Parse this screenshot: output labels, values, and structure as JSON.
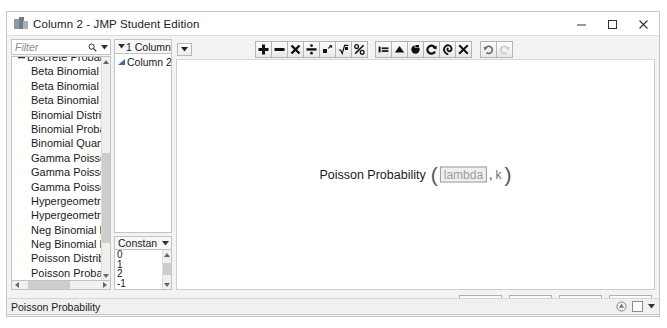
{
  "window": {
    "title": "Column 2 - JMP Student Edition",
    "app_icon": "jmp-app-icon",
    "controls": {
      "minimize": "minimize-icon",
      "maximize": "maximize-icon",
      "close": "close-icon"
    }
  },
  "filter": {
    "placeholder": "Filter",
    "value": "",
    "search_icon": "search-icon",
    "dropdown_icon": "chevron-down-icon"
  },
  "function_tree": {
    "nodes": [
      {
        "label": "Discrete Probability",
        "type": "group",
        "expanded": true,
        "twisty": "minus-twisty-icon",
        "clipped": true
      },
      {
        "label": "Beta Binomial D",
        "type": "leaf"
      },
      {
        "label": "Beta Binomial Pr",
        "type": "leaf"
      },
      {
        "label": "Beta Binomial Q",
        "type": "leaf"
      },
      {
        "label": "Binomial Distrib",
        "type": "leaf"
      },
      {
        "label": "Binomial Probab",
        "type": "leaf"
      },
      {
        "label": "Binomial Quanti",
        "type": "leaf"
      },
      {
        "label": "Gamma Poisson",
        "type": "leaf"
      },
      {
        "label": "Gamma Poisson",
        "type": "leaf"
      },
      {
        "label": "Gamma Poisson",
        "type": "leaf"
      },
      {
        "label": "Hypergeometric",
        "type": "leaf"
      },
      {
        "label": "Hypergeometric",
        "type": "leaf"
      },
      {
        "label": "Neg Binomial Di",
        "type": "leaf"
      },
      {
        "label": "Neg Binomial Pr",
        "type": "leaf"
      },
      {
        "label": "Poisson Distribut",
        "type": "leaf"
      },
      {
        "label": "Poisson Probabil",
        "type": "leaf"
      },
      {
        "label": "Poisson Quantile",
        "type": "leaf"
      },
      {
        "label": "Statistical",
        "type": "group",
        "expanded": false,
        "twisty": "right-twisty-icon"
      },
      {
        "label": "Random",
        "type": "group",
        "expanded": false,
        "twisty": "right-twisty-icon"
      },
      {
        "label": "Date Time",
        "type": "group",
        "expanded": false,
        "twisty": "right-twisty-icon"
      },
      {
        "label": "Row State",
        "type": "group",
        "expanded": false,
        "twisty": "right-twisty-icon"
      },
      {
        "label": "Assignment",
        "type": "group",
        "expanded": false,
        "twisty": "right-twisty-icon"
      }
    ]
  },
  "columns_panel": {
    "header": "1 Columns",
    "header_caret": "chevron-down-icon",
    "items": [
      {
        "label": "Column 2",
        "icon": "continuous-column-icon"
      }
    ]
  },
  "constants_panel": {
    "header": "Constan",
    "header_caret": "chevron-down-icon",
    "values": [
      "0",
      "1",
      "2",
      "-1"
    ]
  },
  "editor": {
    "panel_menu_icon": "panel-menu-icon",
    "toolbar": {
      "group1": [
        {
          "name": "add-button",
          "glyph": "plus-icon"
        },
        {
          "name": "subtract-button",
          "glyph": "minus-icon"
        },
        {
          "name": "multiply-button",
          "glyph": "multiply-icon"
        },
        {
          "name": "divide-button",
          "glyph": "divide-icon"
        },
        {
          "name": "exponent-button",
          "glyph": "exponent-icon"
        },
        {
          "name": "root-button",
          "glyph": "root-icon"
        },
        {
          "name": "percent-button",
          "glyph": "percent-icon"
        }
      ],
      "group2": [
        {
          "name": "insert-button",
          "glyph": "insert-icon"
        },
        {
          "name": "peel-button",
          "glyph": "peel-icon"
        },
        {
          "name": "swap-button",
          "glyph": "swap-icon"
        },
        {
          "name": "rotate-button",
          "glyph": "rotate-icon"
        },
        {
          "name": "spiral-button",
          "glyph": "spiral-icon"
        },
        {
          "name": "delete-button",
          "glyph": "delete-x-icon"
        }
      ],
      "group3": [
        {
          "name": "undo-button",
          "glyph": "undo-icon",
          "enabled": true
        },
        {
          "name": "redo-button",
          "glyph": "redo-icon",
          "enabled": false
        }
      ]
    },
    "formula": {
      "function_name": "Poisson Probability",
      "open_paren": "(",
      "arg1": "lambda",
      "arg1_selected": true,
      "separator": ",",
      "arg2": "k",
      "close_paren": ")"
    }
  },
  "footer": {
    "buttons": [
      "OK",
      "Cancel",
      "Apply",
      "Help"
    ]
  },
  "statusbar": {
    "text": "Poisson Probability",
    "resize_icon": "resize-grip-icon",
    "caret_icon": "chevron-down-icon"
  }
}
